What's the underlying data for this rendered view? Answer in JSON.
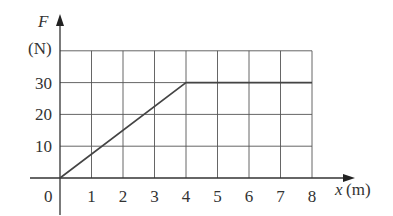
{
  "chart_data": {
    "type": "line",
    "title": "",
    "xlabel": "x (m)",
    "xlabel_var": "x",
    "xlabel_unit": "(m)",
    "ylabel_var": "F",
    "ylabel_unit": "(N)",
    "x_ticks": [
      "1",
      "2",
      "3",
      "4",
      "5",
      "6",
      "7",
      "8"
    ],
    "y_ticks": [
      "10",
      "20",
      "30"
    ],
    "origin_label": "0",
    "xlim": [
      0,
      8
    ],
    "ylim": [
      0,
      40
    ],
    "grid": true,
    "legend": null,
    "series": [
      {
        "name": "F(x)",
        "x": [
          0,
          4,
          8
        ],
        "y": [
          0,
          30,
          30
        ]
      }
    ]
  }
}
